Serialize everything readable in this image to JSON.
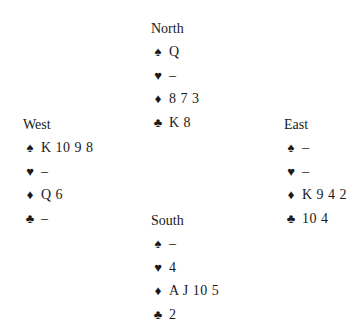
{
  "hands": {
    "north": {
      "name": "North",
      "suits": [
        {
          "symbol": "♠",
          "icon": "spade-icon",
          "cards": "Q"
        },
        {
          "symbol": "♥",
          "icon": "heart-icon",
          "cards": "–"
        },
        {
          "symbol": "♦",
          "icon": "diamond-icon",
          "cards": "8 7 3"
        },
        {
          "symbol": "♣",
          "icon": "club-icon",
          "cards": "K 8"
        }
      ]
    },
    "west": {
      "name": "West",
      "suits": [
        {
          "symbol": "♠",
          "icon": "spade-icon",
          "cards": "K 10 9 8"
        },
        {
          "symbol": "♥",
          "icon": "heart-icon",
          "cards": "–"
        },
        {
          "symbol": "♦",
          "icon": "diamond-icon",
          "cards": "Q 6"
        },
        {
          "symbol": "♣",
          "icon": "club-icon",
          "cards": "–"
        }
      ]
    },
    "east": {
      "name": "East",
      "suits": [
        {
          "symbol": "♠",
          "icon": "spade-icon",
          "cards": "–"
        },
        {
          "symbol": "♥",
          "icon": "heart-icon",
          "cards": "–"
        },
        {
          "symbol": "♦",
          "icon": "diamond-icon",
          "cards": "K 9 4 2"
        },
        {
          "symbol": "♣",
          "icon": "club-icon",
          "cards": "10 4"
        }
      ]
    },
    "south": {
      "name": "South",
      "suits": [
        {
          "symbol": "♠",
          "icon": "spade-icon",
          "cards": "–"
        },
        {
          "symbol": "♥",
          "icon": "heart-icon",
          "cards": "4"
        },
        {
          "symbol": "♦",
          "icon": "diamond-icon",
          "cards": "A J 10 5"
        },
        {
          "symbol": "♣",
          "icon": "club-icon",
          "cards": "2"
        }
      ]
    }
  }
}
